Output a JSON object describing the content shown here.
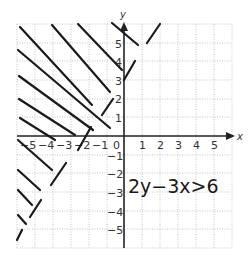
{
  "graph": {
    "x_axis_label": "x",
    "y_axis_label": "y",
    "x_range": [
      -6,
      6
    ],
    "y_range": [
      -6,
      6
    ],
    "x_tick_labels": [
      "−5",
      "−4",
      "−3",
      "−2",
      "−1",
      "0",
      "1",
      "2",
      "3",
      "4",
      "5"
    ],
    "y_tick_labels_positive": [
      "1",
      "2",
      "3",
      "4",
      "5"
    ],
    "y_tick_labels_negative": [
      "−1",
      "−2",
      "−3",
      "−4",
      "−5"
    ],
    "grid_style": "dotted",
    "colors": {
      "grid": "#b5b5b5",
      "axis": "#222222",
      "ink": "#1a1a1a"
    }
  },
  "annotation": {
    "inequality": "2y−3x>6"
  },
  "boundary_line": {
    "equation": "y = 1.5x + 3",
    "style": "dashed (hand-drawn)"
  },
  "shaded_region": "above-left of boundary line (hatched)"
}
